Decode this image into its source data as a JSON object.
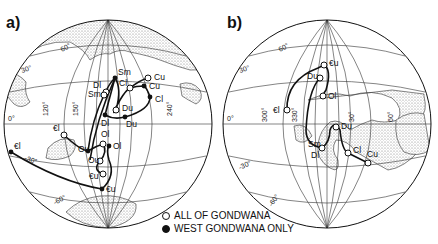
{
  "figure": {
    "panels": [
      {
        "id": "a",
        "label": "a)",
        "grid_labels": {
          "lat": [
            "60°",
            "30°",
            "0°",
            "-30°",
            "-60°"
          ],
          "lon": [
            "120°",
            "150°",
            "240°"
          ]
        },
        "poles": [
          {
            "code": "€l",
            "x": 64,
            "y": 135,
            "type": "open"
          },
          {
            "code": "€l",
            "x": 11,
            "y": 152,
            "type": "filled"
          },
          {
            "code": "Ou",
            "x": 88,
            "y": 151,
            "type": "open"
          },
          {
            "code": "Ol",
            "x": 103,
            "y": 144,
            "type": "open"
          },
          {
            "code": "Ol",
            "x": 109,
            "y": 146,
            "type": "filled"
          },
          {
            "code": "Ou",
            "x": 100,
            "y": 161,
            "type": "open"
          },
          {
            "code": "€u",
            "x": 103,
            "y": 174,
            "type": "open"
          },
          {
            "code": "€u",
            "x": 102,
            "y": 189,
            "type": "filled"
          },
          {
            "code": "Dl",
            "x": 106,
            "y": 92,
            "type": "open"
          },
          {
            "code": "Sm",
            "x": 115,
            "y": 78,
            "type": "filled"
          },
          {
            "code": "Sm",
            "x": 104,
            "y": 95,
            "type": "open"
          },
          {
            "code": "Cl",
            "x": 130,
            "y": 88,
            "type": "open"
          },
          {
            "code": "Cu",
            "x": 148,
            "y": 78,
            "type": "open"
          },
          {
            "code": "Cu",
            "x": 144,
            "y": 86,
            "type": "filled"
          },
          {
            "code": "Cl",
            "x": 150,
            "y": 97,
            "type": "filled"
          },
          {
            "code": "Du",
            "x": 116,
            "y": 110,
            "type": "open"
          },
          {
            "code": "Dl",
            "x": 105,
            "y": 115,
            "type": "filled"
          },
          {
            "code": "Du",
            "x": 125,
            "y": 117,
            "type": "filled"
          }
        ]
      },
      {
        "id": "b",
        "label": "b)",
        "grid_labels": {
          "lat": [
            "60°",
            "30°",
            "0°",
            "-30°",
            "-60°"
          ],
          "lon": [
            "300°",
            "330°",
            "30°",
            "60°"
          ]
        },
        "poles": [
          {
            "code": "€u",
            "x": 324,
            "y": 65,
            "type": "open"
          },
          {
            "code": "Du",
            "x": 320,
            "y": 78,
            "type": "open"
          },
          {
            "code": "Ol",
            "x": 323,
            "y": 96,
            "type": "open"
          },
          {
            "code": "€l",
            "x": 287,
            "y": 110,
            "type": "open"
          },
          {
            "code": "Du",
            "x": 336,
            "y": 127,
            "type": "open"
          },
          {
            "code": "Sm",
            "x": 322,
            "y": 148,
            "type": "open"
          },
          {
            "code": "Dl",
            "x": 322,
            "y": 148,
            "type": "open"
          },
          {
            "code": "Cl",
            "x": 348,
            "y": 153,
            "type": "open"
          },
          {
            "code": "Cu",
            "x": 368,
            "y": 163,
            "type": "open"
          }
        ]
      }
    ],
    "legend": {
      "items": [
        {
          "symbol": "open-circle",
          "label": "ALL OF GONDWANA"
        },
        {
          "symbol": "filled-circle",
          "label": "WEST GONDWANA ONLY"
        }
      ]
    },
    "colors": {
      "ink": "#111111",
      "background": "#ffffff",
      "land_stipple": "#9a9a9a"
    }
  }
}
